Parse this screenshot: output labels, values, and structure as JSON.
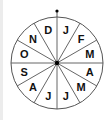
{
  "diagram": {
    "type": "month-wheel",
    "segments": [
      {
        "label": "J",
        "month": "January"
      },
      {
        "label": "F",
        "month": "February"
      },
      {
        "label": "M",
        "month": "March"
      },
      {
        "label": "A",
        "month": "April"
      },
      {
        "label": "M",
        "month": "May"
      },
      {
        "label": "J",
        "month": "June"
      },
      {
        "label": "J",
        "month": "July"
      },
      {
        "label": "A",
        "month": "August"
      },
      {
        "label": "S",
        "month": "September"
      },
      {
        "label": "O",
        "month": "October"
      },
      {
        "label": "N",
        "month": "November"
      },
      {
        "label": "D",
        "month": "December"
      }
    ],
    "colors": {
      "line": "#555555",
      "text": "#111111",
      "hub": "#000000"
    }
  }
}
